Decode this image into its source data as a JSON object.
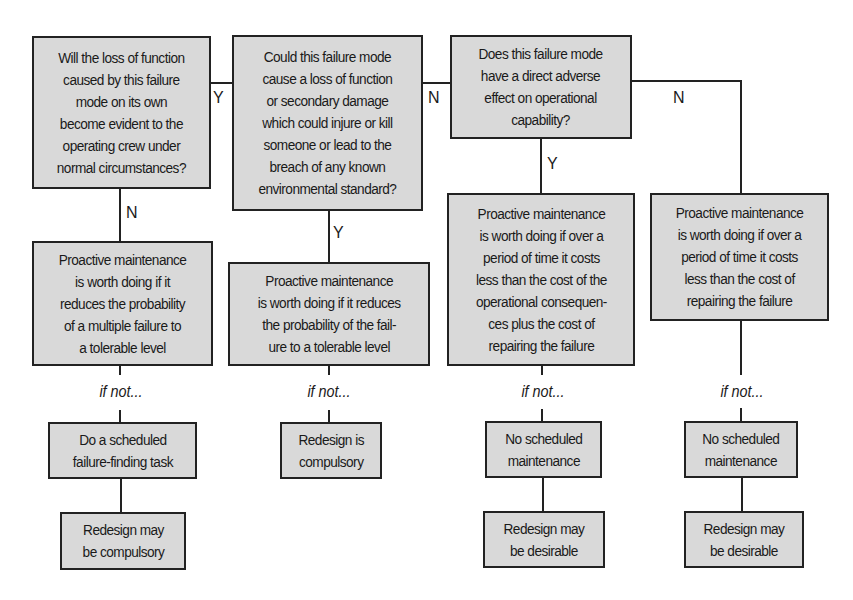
{
  "questions": {
    "q1": "Will the loss of function\ncaused by this failure\nmode on its own\nbecome evident to the\noperating crew under\nnormal circumstances?",
    "q2": "Could this failure mode\ncause a loss of function\nor secondary damage\nwhich could injure or kill\nsomeone or lead to the\nbreach of any known\nenvironmental standard?",
    "q3": "Does this failure mode\nhave a direct adverse\neffect on operational\ncapability?"
  },
  "branch_labels": {
    "q1_yes": "Y",
    "q1_no": "N",
    "q2_yes": "Y",
    "q2_no": "N",
    "q3_yes": "Y",
    "q3_no": "N"
  },
  "columns": [
    {
      "criterion": "Proactive maintenance\nis worth doing if it\nreduces the probability\nof a multiple failure to\na tolerable level",
      "if_not": "if not...",
      "default_action": "Do a scheduled\nfailure-finding task",
      "final": "Redesign may\nbe compulsory"
    },
    {
      "criterion": "Proactive maintenance\nis worth doing if it reduces\nthe probability of the fail-\nure to a tolerable level",
      "if_not": "if not...",
      "default_action": "Redesign is\ncompulsory"
    },
    {
      "criterion": "Proactive maintenance\nis worth doing if over a\nperiod of time it costs\nless than the cost of the\noperational consequen-\nces plus the cost of\nrepairing the failure",
      "if_not": "if not...",
      "default_action": "No scheduled\nmaintenance",
      "final": "Redesign may\nbe desirable"
    },
    {
      "criterion": "Proactive maintenance\nis worth doing if over a\nperiod of time it costs\nless than the cost of\nrepairing the failure",
      "if_not": "if not...",
      "default_action": "No scheduled\nmaintenance",
      "final": "Redesign may\nbe desirable"
    }
  ]
}
